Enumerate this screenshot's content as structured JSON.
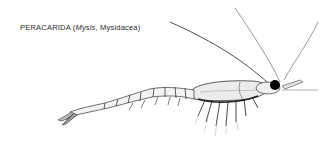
{
  "figure": {
    "caption": {
      "group": "PERACARIDA",
      "open_paren": " (",
      "genus": "Mysis",
      "separator": ", ",
      "order": "Mysidacea",
      "close_paren": ")"
    },
    "illustration": {
      "subject": "Mysis shrimp, lateral view",
      "icon": "mysid-shrimp-drawing"
    },
    "colors": {
      "background": "#ffffff",
      "ink": "#2a2a2a",
      "eye": "#000000",
      "shading": "#bdbdbd"
    }
  }
}
